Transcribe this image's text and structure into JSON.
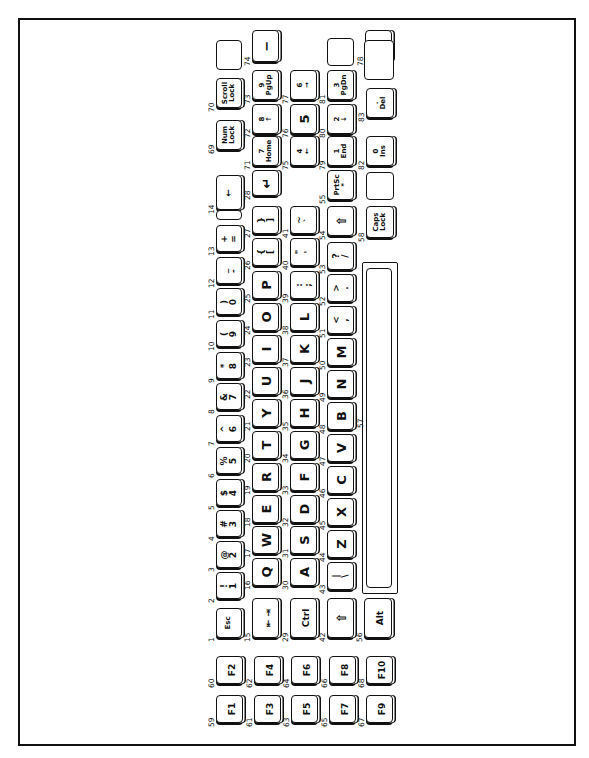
{
  "figure": {
    "orientation": "rotated-90-ccw"
  },
  "keys": {
    "row_number": [
      {
        "code": "1",
        "top": "",
        "bottom": "Esc"
      },
      {
        "code": "2",
        "top": "!",
        "bottom": "1"
      },
      {
        "code": "3",
        "top": "@",
        "bottom": "2"
      },
      {
        "code": "4",
        "top": "#",
        "bottom": "3"
      },
      {
        "code": "5",
        "top": "$",
        "bottom": "4"
      },
      {
        "code": "6",
        "top": "%",
        "bottom": "5"
      },
      {
        "code": "7",
        "top": "^",
        "bottom": "6"
      },
      {
        "code": "8",
        "top": "&",
        "bottom": "7"
      },
      {
        "code": "9",
        "top": "*",
        "bottom": "8"
      },
      {
        "code": "10",
        "top": "(",
        "bottom": "9"
      },
      {
        "code": "11",
        "top": ")",
        "bottom": "0"
      },
      {
        "code": "12",
        "top": "_",
        "bottom": "-"
      },
      {
        "code": "13",
        "top": "+",
        "bottom": "="
      },
      {
        "code": "14",
        "top": "",
        "bottom": "←"
      },
      {
        "code": "69",
        "top": "Num",
        "bottom": "Lock"
      },
      {
        "code": "70",
        "top": "Scroll",
        "bottom": "Lock"
      },
      {
        "code": "",
        "top": "",
        "bottom": "Break"
      }
    ],
    "row_qwerty": [
      {
        "code": "15",
        "label": "⇤ ⇥"
      },
      {
        "code": "16",
        "label": "Q"
      },
      {
        "code": "17",
        "label": "W"
      },
      {
        "code": "18",
        "label": "E"
      },
      {
        "code": "19",
        "label": "R"
      },
      {
        "code": "20",
        "label": "T"
      },
      {
        "code": "21",
        "label": "Y"
      },
      {
        "code": "22",
        "label": "U"
      },
      {
        "code": "23",
        "label": "I"
      },
      {
        "code": "24",
        "label": "O"
      },
      {
        "code": "25",
        "label": "P"
      },
      {
        "code": "26",
        "top": "{",
        "bottom": "["
      },
      {
        "code": "27",
        "top": "}",
        "bottom": "]"
      },
      {
        "code": "28",
        "label": "↵"
      },
      {
        "code": "71",
        "top": "7",
        "bottom": "Home"
      },
      {
        "code": "72",
        "top": "8",
        "bottom": "↑"
      },
      {
        "code": "73",
        "top": "9",
        "bottom": "PgUp"
      },
      {
        "code": "74",
        "label": "−"
      }
    ],
    "row_asdf": [
      {
        "code": "29",
        "label": "Ctrl"
      },
      {
        "code": "30",
        "label": "A"
      },
      {
        "code": "31",
        "label": "S"
      },
      {
        "code": "32",
        "label": "D"
      },
      {
        "code": "33",
        "label": "F"
      },
      {
        "code": "34",
        "label": "G"
      },
      {
        "code": "35",
        "label": "H"
      },
      {
        "code": "36",
        "label": "J"
      },
      {
        "code": "37",
        "label": "K"
      },
      {
        "code": "38",
        "label": "L"
      },
      {
        "code": "39",
        "top": ":",
        "bottom": ";"
      },
      {
        "code": "40",
        "top": "\"",
        "bottom": "'"
      },
      {
        "code": "41",
        "top": "~",
        "bottom": "`"
      },
      {
        "code": "75",
        "top": "4",
        "bottom": "←"
      },
      {
        "code": "76",
        "label": "5"
      },
      {
        "code": "77",
        "top": "6",
        "bottom": "→"
      },
      {
        "code": "78",
        "label": "+"
      }
    ],
    "row_zxcv": [
      {
        "code": "42",
        "label": "⇧"
      },
      {
        "code": "43",
        "top": "|",
        "bottom": "\\"
      },
      {
        "code": "44",
        "label": "Z"
      },
      {
        "code": "45",
        "label": "X"
      },
      {
        "code": "46",
        "label": "C"
      },
      {
        "code": "47",
        "label": "V"
      },
      {
        "code": "48",
        "label": "B"
      },
      {
        "code": "49",
        "label": "N"
      },
      {
        "code": "50",
        "label": "M"
      },
      {
        "code": "51",
        "top": "<",
        "bottom": ","
      },
      {
        "code": "52",
        "top": ">",
        "bottom": "."
      },
      {
        "code": "53",
        "top": "?",
        "bottom": "/"
      },
      {
        "code": "54",
        "label": "⇧"
      },
      {
        "code": "55",
        "top": "PrtSc",
        "bottom": "*"
      },
      {
        "code": "79",
        "top": "1",
        "bottom": "End"
      },
      {
        "code": "80",
        "top": "2",
        "bottom": "↓"
      },
      {
        "code": "81",
        "top": "3",
        "bottom": "PgDn"
      }
    ],
    "row_space": [
      {
        "code": "56",
        "label": "Alt"
      },
      {
        "code": "57",
        "label": ""
      },
      {
        "code": "58",
        "top": "Caps",
        "bottom": "Lock"
      },
      {
        "code": "82",
        "top": "0",
        "bottom": "Ins"
      },
      {
        "code": "83",
        "top": ".",
        "bottom": "Del"
      }
    ],
    "function_keys": [
      {
        "code": "59",
        "label": "F1"
      },
      {
        "code": "60",
        "label": "F2"
      },
      {
        "code": "61",
        "label": "F3"
      },
      {
        "code": "62",
        "label": "F4"
      },
      {
        "code": "63",
        "label": "F5"
      },
      {
        "code": "64",
        "label": "F6"
      },
      {
        "code": "65",
        "label": "F7"
      },
      {
        "code": "66",
        "label": "F8"
      },
      {
        "code": "67",
        "label": "F9"
      },
      {
        "code": "68",
        "label": "F10"
      }
    ]
  }
}
